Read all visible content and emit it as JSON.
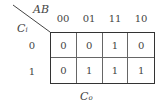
{
  "kmap": {
    "column_variable": "AB",
    "row_variable": {
      "base": "C",
      "sub": "i"
    },
    "output_label": {
      "base": "C",
      "sub": "o"
    },
    "column_headers": [
      "00",
      "01",
      "11",
      "10"
    ],
    "row_headers": [
      "0",
      "1"
    ],
    "cells": [
      [
        "0",
        "0",
        "1",
        "0"
      ],
      [
        "0",
        "1",
        "1",
        "1"
      ]
    ]
  }
}
